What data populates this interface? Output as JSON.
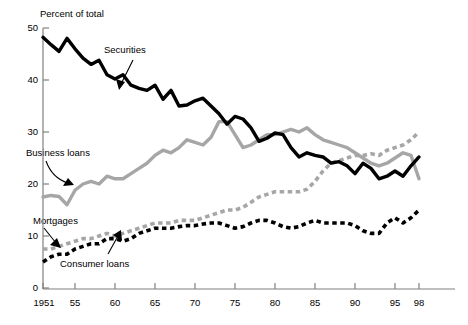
{
  "chart_data": {
    "type": "line",
    "title": "",
    "ylabel": "Percent of total",
    "xlabel": "",
    "ylim": [
      0,
      50
    ],
    "xlim": [
      1951,
      1998
    ],
    "grid": false,
    "legend_position": "inline-annotations",
    "yticks": [
      0,
      10,
      20,
      30,
      40,
      50
    ],
    "ytick_labels": [
      "0",
      "10",
      "20",
      "30",
      "40",
      "50"
    ],
    "xticks": [
      1951,
      1955,
      1960,
      1965,
      1970,
      1975,
      1980,
      1985,
      1990,
      1995,
      1998
    ],
    "xtick_labels": [
      "1951",
      "55",
      "60",
      "65",
      "70",
      "75",
      "80",
      "85",
      "90",
      "95",
      "98"
    ],
    "x": [
      1951,
      1952,
      1953,
      1954,
      1955,
      1956,
      1957,
      1958,
      1959,
      1960,
      1961,
      1962,
      1963,
      1964,
      1965,
      1966,
      1967,
      1968,
      1969,
      1970,
      1971,
      1972,
      1973,
      1974,
      1975,
      1976,
      1977,
      1978,
      1979,
      1980,
      1981,
      1982,
      1983,
      1984,
      1985,
      1986,
      1987,
      1988,
      1989,
      1990,
      1991,
      1992,
      1993,
      1994,
      1995,
      1996,
      1997,
      1998
    ],
    "series": [
      {
        "name": "Securities",
        "color": "#000000",
        "style": "solid",
        "values": [
          48.2,
          46.8,
          45.5,
          48.0,
          46.0,
          44.2,
          43.0,
          43.8,
          41.0,
          40.2,
          41.0,
          39.0,
          38.4,
          38.0,
          39.0,
          36.3,
          38.0,
          35.0,
          35.2,
          36.0,
          36.5,
          35.0,
          33.5,
          31.5,
          33.0,
          32.5,
          30.8,
          28.2,
          28.8,
          29.8,
          29.5,
          27.0,
          25.2,
          26.0,
          25.5,
          25.2,
          24.0,
          24.3,
          23.5,
          22.0,
          24.0,
          23.0,
          21.0,
          21.5,
          22.5,
          21.5,
          23.5,
          25.2
        ]
      },
      {
        "name": "Business loans",
        "color": "#a6a6a6",
        "style": "solid",
        "values": [
          17.5,
          17.8,
          17.6,
          16.0,
          18.8,
          20.0,
          20.5,
          20.0,
          21.5,
          21.0,
          21.0,
          22.0,
          23.0,
          24.0,
          25.5,
          26.5,
          26.0,
          27.0,
          28.5,
          28.0,
          27.5,
          29.0,
          32.0,
          32.0,
          29.5,
          27.0,
          27.5,
          28.5,
          29.5,
          29.5,
          30.0,
          30.5,
          30.0,
          30.8,
          29.5,
          28.5,
          28.0,
          27.5,
          27.0,
          26.0,
          25.0,
          24.0,
          23.5,
          24.0,
          25.0,
          26.0,
          25.5,
          21.0
        ]
      },
      {
        "name": "Mortgages",
        "color": "#a6a6a6",
        "style": "dashed",
        "values": [
          7.5,
          7.5,
          8.0,
          8.5,
          9.0,
          9.5,
          9.5,
          10.0,
          10.5,
          10.0,
          10.5,
          11.0,
          11.5,
          12.0,
          12.5,
          12.5,
          12.5,
          13.0,
          13.0,
          13.0,
          13.5,
          14.0,
          14.5,
          15.0,
          15.0,
          15.5,
          16.5,
          17.5,
          18.0,
          18.5,
          18.5,
          18.5,
          18.5,
          19.0,
          20.5,
          22.5,
          24.0,
          24.5,
          25.0,
          25.5,
          25.5,
          25.8,
          25.5,
          26.5,
          27.0,
          27.5,
          28.5,
          30.0
        ]
      },
      {
        "name": "Consumer loans",
        "color": "#000000",
        "style": "dashed",
        "values": [
          5.0,
          6.0,
          6.5,
          6.5,
          7.5,
          8.0,
          8.5,
          8.5,
          9.5,
          9.5,
          9.0,
          9.5,
          10.5,
          11.0,
          11.5,
          11.5,
          11.5,
          11.8,
          12.0,
          12.0,
          12.3,
          12.5,
          12.5,
          12.0,
          11.5,
          11.8,
          12.5,
          13.0,
          13.0,
          12.5,
          11.8,
          11.5,
          11.8,
          12.5,
          13.0,
          12.5,
          12.5,
          12.5,
          12.5,
          12.0,
          11.0,
          10.5,
          10.5,
          12.5,
          13.5,
          12.5,
          13.5,
          15.0
        ]
      }
    ],
    "annotations": [
      {
        "text": "Securities",
        "target": "Securities"
      },
      {
        "text": "Business loans",
        "target": "Business loans"
      },
      {
        "text": "Mortgages",
        "target": "Mortgages"
      },
      {
        "text": "Consumer loans",
        "target": "Consumer loans"
      }
    ]
  },
  "axis": {
    "ylabel": "Percent of total",
    "y0": "0",
    "y10": "10",
    "y20": "20",
    "y30": "30",
    "y40": "40",
    "y50": "50",
    "x1951": "1951",
    "x55": "55",
    "x60": "60",
    "x65": "65",
    "x70": "70",
    "x75": "75",
    "x80": "80",
    "x85": "85",
    "x90": "90",
    "x95": "95",
    "x98": "98"
  },
  "labels": {
    "securities": "Securities",
    "business_loans": "Business loans",
    "mortgages": "Mortgages",
    "consumer_loans": "Consumer loans"
  }
}
